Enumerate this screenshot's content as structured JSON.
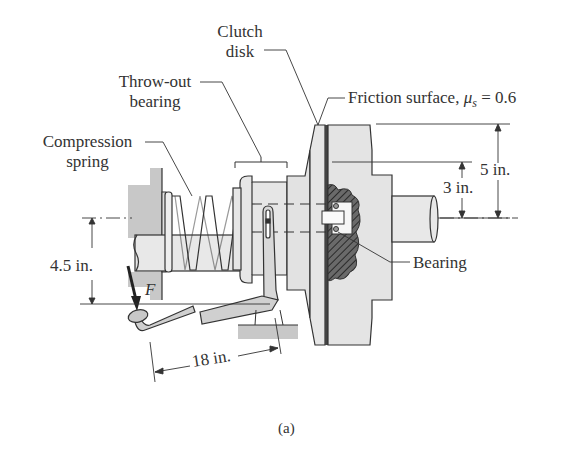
{
  "figure": {
    "caption": "(a)",
    "labels": {
      "clutch_disk_line1": "Clutch",
      "clutch_disk_line2": "disk",
      "throw_out_line1": "Throw-out",
      "throw_out_line2": "bearing",
      "compression_line1": "Compression",
      "compression_line2": "spring",
      "friction_surface": "Friction surface, ",
      "mu_symbol": "μ",
      "mu_subscript": "s",
      "mu_value": " = 0.6",
      "bearing": "Bearing",
      "force": "F"
    },
    "dimensions": {
      "outer_radius": "5 in.",
      "inner_radius": "3 in.",
      "pedal_height": "4.5 in.",
      "pedal_length": "18 in."
    },
    "colors": {
      "line": "#3a3a3a",
      "fill_light": "#e4e4e4",
      "fill_mid": "#cfcfcf",
      "fill_dark": "#555555",
      "ground": "#c8c8c8"
    }
  }
}
